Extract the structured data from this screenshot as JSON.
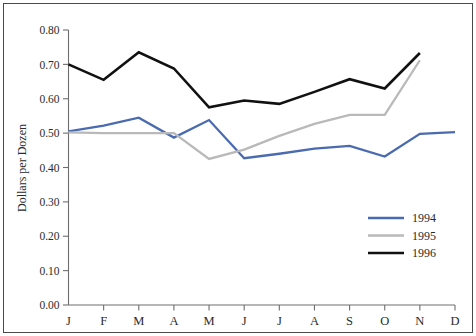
{
  "chart_data": {
    "type": "line",
    "title": "",
    "xlabel": "",
    "ylabel": "Dollars per Dozen",
    "categories": [
      "J",
      "F",
      "M",
      "A",
      "M",
      "J",
      "J",
      "A",
      "S",
      "O",
      "N",
      "D"
    ],
    "ylim": [
      0.0,
      0.8
    ],
    "ytick_labels": [
      "0.80",
      "0.70",
      "0.60",
      "0.50",
      "0.40",
      "0.30",
      "0.20",
      "0.10",
      "0.00"
    ],
    "ytick_values": [
      0.8,
      0.7,
      0.6,
      0.5,
      0.4,
      0.3,
      0.2,
      0.1,
      0.0
    ],
    "grid": false,
    "legend_position": "bottom-right",
    "series": [
      {
        "name": "1994",
        "color": "#4a6bb0",
        "values": [
          0.505,
          0.522,
          0.545,
          0.487,
          0.538,
          0.427,
          0.44,
          0.455,
          0.463,
          0.432,
          0.498,
          0.503
        ]
      },
      {
        "name": "1995",
        "color": "#b9b9b9",
        "values": [
          0.502,
          0.5,
          0.5,
          0.5,
          0.425,
          0.452,
          0.492,
          0.527,
          0.553,
          0.553,
          0.712,
          null
        ]
      },
      {
        "name": "1996",
        "color": "#111111",
        "values": [
          0.7,
          0.655,
          0.735,
          0.688,
          0.575,
          0.595,
          0.585,
          0.62,
          0.657,
          0.63,
          0.733,
          null
        ]
      }
    ]
  },
  "legend": {
    "entries": [
      {
        "label": "1994",
        "color": "#4a6bb0"
      },
      {
        "label": "1995",
        "color": "#b9b9b9"
      },
      {
        "label": "1996",
        "color": "#111111"
      }
    ]
  },
  "axes": {
    "y_title": "Dollars per Dozen"
  }
}
